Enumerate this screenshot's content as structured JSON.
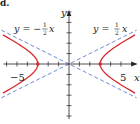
{
  "figure": {
    "panel_label": "d.",
    "axes": {
      "x_label": "x",
      "y_label": "y",
      "tick_labels": {
        "neg5": "−5",
        "pos5": "5"
      },
      "origin_px": [
        69,
        64
      ],
      "px_per_unit": 10.4,
      "x_range": [
        -6.3,
        6.6
      ],
      "y_range": [
        -5.3,
        5.2
      ],
      "tick_step": 1
    },
    "asymptote_labels": {
      "negative": {
        "lhs": "y = −",
        "num": "1",
        "den": "2",
        "var": "x"
      },
      "positive": {
        "lhs": "y = ",
        "num": "1",
        "den": "2",
        "var": "x"
      }
    },
    "colors": {
      "curve": "#d42a2a",
      "asymptote": "#5b7fc4",
      "axis": "#231f20"
    }
  },
  "chart_data": {
    "type": "line",
    "title": "",
    "xlabel": "x",
    "ylabel": "y",
    "xlim": [
      -6.3,
      6.6
    ],
    "ylim": [
      -5.3,
      5.2
    ],
    "grid": false,
    "x_ticks": [
      -6,
      -5,
      -4,
      -3,
      -2,
      -1,
      1,
      2,
      3,
      4,
      5,
      6
    ],
    "x_tick_labels": {
      "-5": "−5",
      "5": "5"
    },
    "series": [
      {
        "name": "hyperbola (right branch)",
        "equation": "x^2/9 - y^2/(9/4) = 1",
        "style": "solid red",
        "points": [
          [
            6.3,
            2.77
          ],
          [
            5,
            2.0
          ],
          [
            4,
            1.32
          ],
          [
            3.5,
            0.9
          ],
          [
            3.2,
            0.56
          ],
          [
            3,
            0
          ],
          [
            3.2,
            -0.56
          ],
          [
            3.5,
            -0.9
          ],
          [
            4,
            -1.32
          ],
          [
            5,
            -2.0
          ],
          [
            6.3,
            -2.77
          ]
        ]
      },
      {
        "name": "hyperbola (left branch)",
        "equation": "x^2/9 - y^2/(9/4) = 1",
        "style": "solid red",
        "points": [
          [
            -6.3,
            2.77
          ],
          [
            -5,
            2.0
          ],
          [
            -4,
            1.32
          ],
          [
            -3.5,
            0.9
          ],
          [
            -3.2,
            0.56
          ],
          [
            -3,
            0
          ],
          [
            -3.2,
            -0.56
          ],
          [
            -3.5,
            -0.9
          ],
          [
            -4,
            -1.32
          ],
          [
            -5,
            -2.0
          ],
          [
            -6.3,
            -2.77
          ]
        ]
      },
      {
        "name": "y = 1/2 x",
        "style": "dashed blue",
        "points": [
          [
            -6.5,
            -3.25
          ],
          [
            6.5,
            3.25
          ]
        ]
      },
      {
        "name": "y = -1/2 x",
        "style": "dashed blue",
        "points": [
          [
            -6.5,
            3.25
          ],
          [
            6.5,
            -3.25
          ]
        ]
      }
    ],
    "vertices": [
      [
        -3,
        0
      ],
      [
        3,
        0
      ]
    ],
    "annotations": [
      "y = −½x",
      "y = ½x",
      "−5",
      "5",
      "x",
      "y",
      "d."
    ]
  }
}
